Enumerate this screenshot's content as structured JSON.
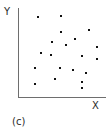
{
  "figure": {
    "caption": "(c)",
    "y_axis_label": "Y",
    "x_axis_label": "X",
    "background_color": "#ffffff",
    "axis_color": "#6e6e6e",
    "point_color": "#111111"
  },
  "chart_data": {
    "type": "scatter",
    "title": "",
    "subtitle": "",
    "xlabel": "X",
    "ylabel": "Y",
    "caption": "(c)",
    "grid": false,
    "legend": null,
    "legend_position": "none",
    "axis_ticks": false,
    "tick_labels": {
      "x": [],
      "y": []
    },
    "xlim": [
      0,
      100
    ],
    "ylim": [
      0,
      100
    ],
    "n_points": 20,
    "series": [
      {
        "name": "observations",
        "marker": "square",
        "color": "#111111",
        "points": [
          {
            "x": 23,
            "y": 90
          },
          {
            "x": 49,
            "y": 91
          },
          {
            "x": 49,
            "y": 73
          },
          {
            "x": 81,
            "y": 75
          },
          {
            "x": 39,
            "y": 62
          },
          {
            "x": 55,
            "y": 58
          },
          {
            "x": 65,
            "y": 65
          },
          {
            "x": 90,
            "y": 56
          },
          {
            "x": 26,
            "y": 50
          },
          {
            "x": 38,
            "y": 48
          },
          {
            "x": 73,
            "y": 47
          },
          {
            "x": 90,
            "y": 44
          },
          {
            "x": 19,
            "y": 34
          },
          {
            "x": 48,
            "y": 34
          },
          {
            "x": 63,
            "y": 31
          },
          {
            "x": 78,
            "y": 28
          },
          {
            "x": 42,
            "y": 21
          },
          {
            "x": 73,
            "y": 17
          },
          {
            "x": 19,
            "y": 15
          },
          {
            "x": 73,
            "y": 11
          }
        ]
      }
    ],
    "pixel_points": [
      {
        "x": 38,
        "y": 17
      },
      {
        "x": 61,
        "y": 16
      },
      {
        "x": 61,
        "y": 32
      },
      {
        "x": 89,
        "y": 30
      },
      {
        "x": 52,
        "y": 42
      },
      {
        "x": 66,
        "y": 45
      },
      {
        "x": 75,
        "y": 39
      },
      {
        "x": 97,
        "y": 47
      },
      {
        "x": 41,
        "y": 53
      },
      {
        "x": 51,
        "y": 55
      },
      {
        "x": 82,
        "y": 56
      },
      {
        "x": 97,
        "y": 59
      },
      {
        "x": 35,
        "y": 68
      },
      {
        "x": 60,
        "y": 68
      },
      {
        "x": 73,
        "y": 70
      },
      {
        "x": 86,
        "y": 73
      },
      {
        "x": 55,
        "y": 79
      },
      {
        "x": 82,
        "y": 82
      },
      {
        "x": 35,
        "y": 84
      },
      {
        "x": 82,
        "y": 88
      }
    ]
  }
}
